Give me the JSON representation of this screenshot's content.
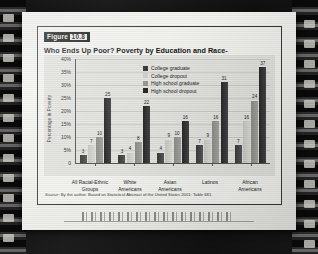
{
  "figure": {
    "badge_word": "Figure",
    "badge_number": "10.8",
    "title": "Who Ends Up Poor? Poverty by Education and Race-Ethnicity",
    "source_prefix": "Source:",
    "source_text": "By the author. Based on Statistical Abstract of the United States 2001: Table 681."
  },
  "chart_data": {
    "type": "bar",
    "title": "Who Ends Up Poor? Poverty by Education and Race-Ethnicity",
    "xlabel": "",
    "ylabel": "Percentage in Poverty",
    "ylim": [
      0,
      40
    ],
    "ytick_labels": [
      "40%",
      "35%",
      "30%",
      "25%",
      "20%",
      "15%",
      "10%",
      "5%",
      "0"
    ],
    "ytick_values": [
      40,
      35,
      30,
      25,
      20,
      15,
      10,
      5,
      0
    ],
    "grid": true,
    "legend_position": "inside-top-center",
    "categories": [
      "All Racial-Ethnic Groups",
      "White Americans",
      "Asian Americans",
      "Latinos",
      "African Americans"
    ],
    "category_lines": [
      [
        "All Racial-Ethnic",
        "Groups"
      ],
      [
        "White",
        "Americans"
      ],
      [
        "Asian",
        "Americans"
      ],
      [
        "Latinos",
        ""
      ],
      [
        "African",
        "Americans"
      ]
    ],
    "series": [
      {
        "name": "College graduate",
        "color": "#3b3b3b",
        "values": [
          3,
          3,
          4,
          7,
          7
        ]
      },
      {
        "name": "College dropout",
        "color": "#d2d2cd",
        "values": [
          7,
          4,
          9,
          9,
          16
        ]
      },
      {
        "name": "High school graduate",
        "color": "#9a9a95",
        "values": [
          10,
          8,
          10,
          16,
          24
        ]
      },
      {
        "name": "High school dropout",
        "color": "#2a2a2a",
        "values": [
          25,
          22,
          16,
          31,
          37
        ]
      }
    ]
  }
}
